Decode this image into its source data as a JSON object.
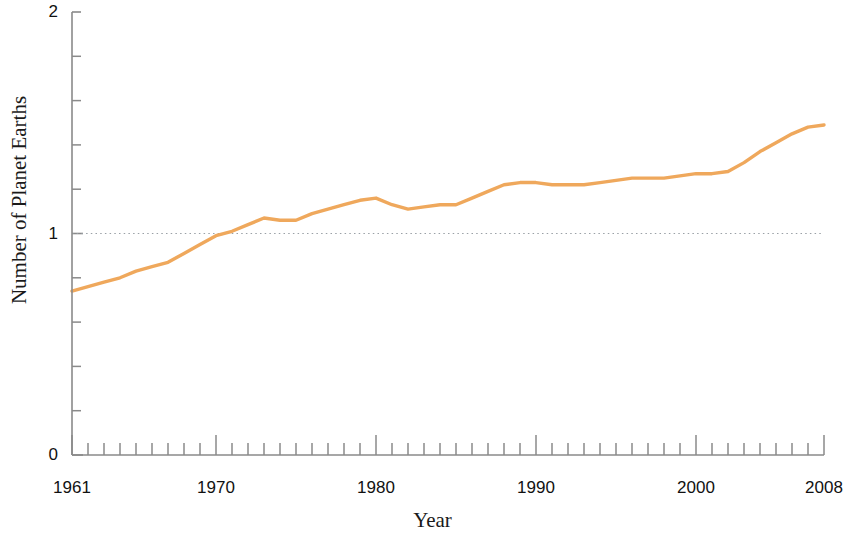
{
  "chart_data": {
    "type": "line",
    "title": "",
    "xlabel": "Year",
    "ylabel": "Number of Planet Earths",
    "xlim": [
      1961,
      2008
    ],
    "ylim": [
      0,
      2
    ],
    "y_ticks_major": [
      0,
      1,
      2
    ],
    "y_tick_labels": [
      "0",
      "1",
      "2"
    ],
    "y_minor_step": 0.2,
    "x_ticks_major": [
      1961,
      1970,
      1980,
      1990,
      2000,
      2008
    ],
    "x_tick_labels": [
      "1961",
      "1970",
      "1980",
      "1990",
      "2000",
      "2008"
    ],
    "x_minor_step": 1,
    "grid": "single horizontal dotted reference line at y = 1",
    "reference_line_value": 1,
    "legend": null,
    "series": [
      {
        "name": "Humanity's Ecological Footprint",
        "color": "#EFA85C",
        "x": [
          1961,
          1962,
          1963,
          1964,
          1965,
          1966,
          1967,
          1968,
          1969,
          1970,
          1971,
          1972,
          1973,
          1974,
          1975,
          1976,
          1977,
          1978,
          1979,
          1980,
          1981,
          1982,
          1983,
          1984,
          1985,
          1986,
          1987,
          1988,
          1989,
          1990,
          1991,
          1992,
          1993,
          1994,
          1995,
          1996,
          1997,
          1998,
          1999,
          2000,
          2001,
          2002,
          2003,
          2004,
          2005,
          2006,
          2007,
          2008
        ],
        "values": [
          0.74,
          0.76,
          0.78,
          0.8,
          0.83,
          0.85,
          0.87,
          0.91,
          0.95,
          0.99,
          1.01,
          1.04,
          1.07,
          1.06,
          1.06,
          1.09,
          1.11,
          1.13,
          1.15,
          1.16,
          1.13,
          1.11,
          1.12,
          1.13,
          1.13,
          1.16,
          1.19,
          1.22,
          1.23,
          1.23,
          1.22,
          1.22,
          1.22,
          1.23,
          1.24,
          1.25,
          1.25,
          1.25,
          1.26,
          1.27,
          1.27,
          1.28,
          1.32,
          1.37,
          1.41,
          1.45,
          1.48,
          1.49
        ]
      }
    ]
  },
  "axes": {
    "y_title": "Number of Planet Earths",
    "x_title": "Year"
  }
}
